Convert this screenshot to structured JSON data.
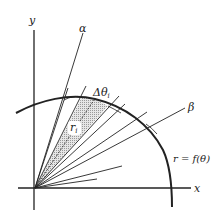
{
  "diagram": {
    "axes": {
      "x_label": "x",
      "y_label": "y"
    },
    "rays": {
      "alpha_label": "α",
      "beta_label": "β"
    },
    "sector": {
      "delta_label_main": "Δθ",
      "delta_label_sub": "i",
      "radius_label_main": "r",
      "radius_label_sub": "i"
    },
    "curve_label": "r = f(θ)",
    "colors": {
      "ink": "#222222",
      "shade": "#c8c8c8",
      "background": "#ffffff"
    }
  }
}
